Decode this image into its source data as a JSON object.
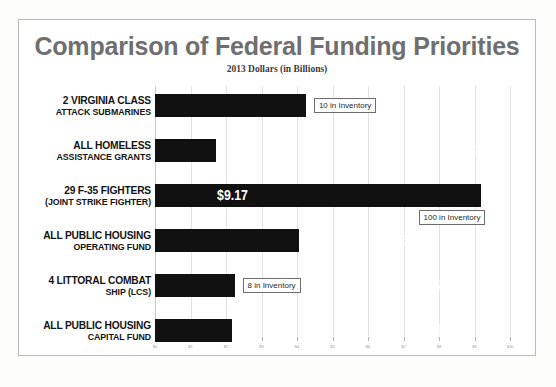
{
  "chart_data": {
    "type": "bar",
    "orientation": "horizontal",
    "title": "Comparison of Federal Funding Priorities",
    "subtitle": "2013 Dollars (in Billions)",
    "xlabel": "",
    "ylabel": "",
    "xlim": [
      0,
      10
    ],
    "grid": true,
    "legend": "none",
    "tick_labels": [
      "$0",
      "$1",
      "$2",
      "$3",
      "$4",
      "$5",
      "$6",
      "$7",
      "$8",
      "$9",
      "$10"
    ],
    "tick_values": [
      0,
      1,
      2,
      3,
      4,
      5,
      6,
      7,
      8,
      9,
      10
    ],
    "categories": [
      "2 VIRGINIA CLASS ATTACK SUBMARINES",
      "ALL HOMELESS ASSISTANCE GRANTS",
      "29 F-35 FIGHTERS (JOINT STRIKE FIGHTER)",
      "ALL PUBLIC HOUSING OPERATING FUND",
      "4 LITTORAL COMBAT SHIP (LCS)",
      "ALL PUBLIC HOUSING CAPITAL FUND"
    ],
    "values": [
      4.25,
      1.73,
      9.17,
      4.06,
      2.24,
      2.18
    ],
    "value_labels": [
      "$4.25",
      "$1.73",
      "$9.17",
      "$4.06",
      "$2.24",
      "$2.18"
    ],
    "bar_color": "#111111",
    "annotations": [
      {
        "category_index": 0,
        "text": "10 in Inventory"
      },
      {
        "category_index": 2,
        "text": "100 in Inventory"
      },
      {
        "category_index": 4,
        "text": "8 in Inventory"
      }
    ]
  },
  "rows": [
    {
      "label_line1": "2 VIRGINIA CLASS",
      "label_line2": "ATTACK SUBMARINES",
      "lead_size": "big",
      "rest_size": "sm",
      "value_label": "$4.25",
      "note": "10 in Inventory"
    },
    {
      "label_line1": "ALL HOMELESS",
      "label_line2": "ASSISTANCE GRANTS",
      "lead_size": "big",
      "rest_size": "sm",
      "value_label": "$1.73",
      "note": ""
    },
    {
      "label_line1": "29 F-35 FIGHTERS",
      "label_line2": "(JOINT STRIKE FIGHTER)",
      "lead_size": "big",
      "rest_size": "sm",
      "value_label": "$9.17",
      "note": "100 in Inventory"
    },
    {
      "label_line1": "ALL PUBLIC HOUSING",
      "label_line2": "OPERATING FUND",
      "lead_size": "big",
      "rest_size": "sm",
      "value_label": "$4.06",
      "note": ""
    },
    {
      "label_line1": "4 LITTORAL COMBAT",
      "label_line2": "SHIP (LCS)",
      "lead_size": "big",
      "rest_size": "sm",
      "value_label": "$2.24",
      "note": "8 in Inventory"
    },
    {
      "label_line1": "ALL PUBLIC HOUSING",
      "label_line2": "CAPITAL FUND",
      "lead_size": "big",
      "rest_size": "sm",
      "value_label": "$2.18",
      "note": ""
    }
  ],
  "colors": {
    "title": "#6f6f6f",
    "bar": "#111111",
    "grid": "#e2e2e2",
    "frame": "#b9b9b9",
    "value_text": "#ffffff"
  }
}
